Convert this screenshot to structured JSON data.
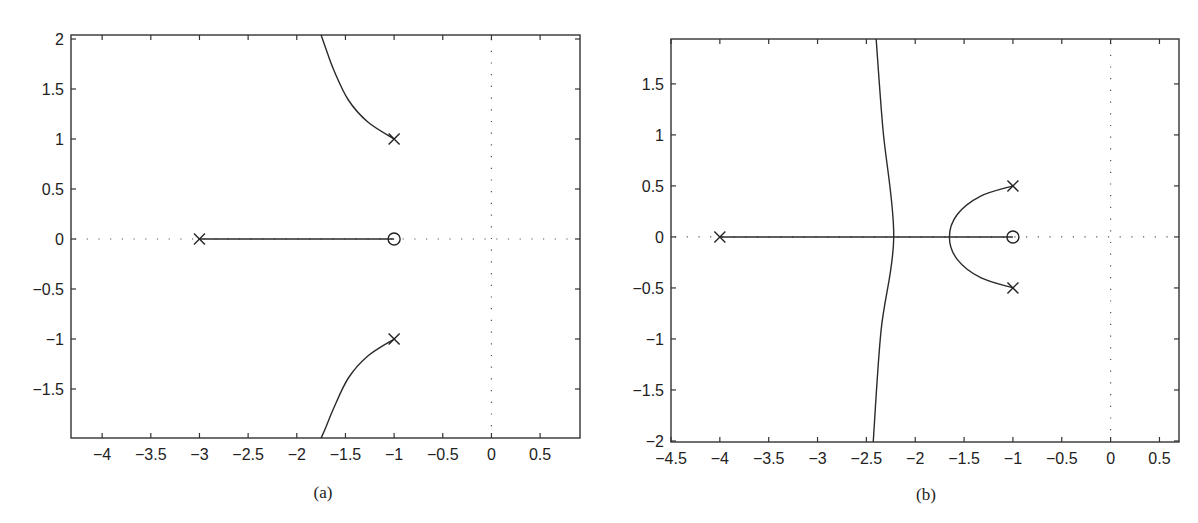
{
  "figure": {
    "captions": [
      "(a)",
      "(b)"
    ]
  },
  "chart_data": [
    {
      "type": "line",
      "title": "",
      "caption": "(a)",
      "subtype": "root-locus",
      "xlabel": "",
      "ylabel": "",
      "xlim": [
        -4.32,
        0.91
      ],
      "ylim": [
        -1.99,
        2.04
      ],
      "grid": false,
      "xticks": [
        -4,
        -3.5,
        -3,
        -2.5,
        -2,
        -1.5,
        -1,
        -0.5,
        0,
        0.5
      ],
      "xtick_labels": [
        "−4",
        "−3.5",
        "−3",
        "−2.5",
        "−2",
        "−1.5",
        "−1",
        "−0.5",
        "0",
        "0.5"
      ],
      "yticks": [
        2,
        1.5,
        1,
        0.5,
        0,
        -0.5,
        -1,
        -1.5
      ],
      "ytick_labels": [
        "2",
        "1.5",
        "1",
        "0.5",
        "0",
        "−0.5",
        "−1",
        "−1.5"
      ],
      "poles": [
        [
          -3,
          0
        ],
        [
          -1,
          1
        ],
        [
          -1,
          -1
        ]
      ],
      "zeros": [
        [
          -1,
          0
        ]
      ],
      "series": [
        {
          "name": "real-axis-branch",
          "x": [
            -3,
            -1
          ],
          "y": [
            0,
            0
          ]
        },
        {
          "name": "upper-branch",
          "x": [
            -1,
            -1.27,
            -1.47,
            -1.62,
            -1.7,
            -1.75
          ],
          "y": [
            1,
            1.17,
            1.39,
            1.69,
            1.9,
            2.04
          ]
        },
        {
          "name": "lower-branch",
          "x": [
            -1,
            -1.27,
            -1.47,
            -1.62,
            -1.7,
            -1.75
          ],
          "y": [
            -1,
            -1.17,
            -1.39,
            -1.69,
            -1.88,
            -1.99
          ]
        }
      ],
      "reference_lines": {
        "imag_axis_x": 0,
        "real_axis_y": 0,
        "style": "dotted"
      }
    },
    {
      "type": "line",
      "title": "",
      "caption": "(b)",
      "subtype": "root-locus",
      "xlabel": "",
      "ylabel": "",
      "xlim": [
        -4.5,
        0.7
      ],
      "ylim": [
        -2.01,
        1.94
      ],
      "grid": false,
      "xticks": [
        -4.5,
        -4,
        -3.5,
        -3,
        -2.5,
        -2,
        -1.5,
        -1,
        -0.5,
        0,
        0.5
      ],
      "xtick_labels": [
        "−4.5",
        "−4",
        "−3.5",
        "−3",
        "−2.5",
        "−2",
        "−1.5",
        "−1",
        "−0.5",
        "0",
        "0.5"
      ],
      "yticks": [
        1.5,
        1,
        0.5,
        0,
        -0.5,
        -1,
        -1.5,
        -2
      ],
      "ytick_labels": [
        "1.5",
        "1",
        "0.5",
        "0",
        "−0.5",
        "−1",
        "−1.5",
        "−2"
      ],
      "poles": [
        [
          -4,
          0
        ],
        [
          -1,
          0.5
        ],
        [
          -1,
          -0.5
        ]
      ],
      "zeros": [
        [
          -1,
          0
        ]
      ],
      "series": [
        {
          "name": "real-axis-branch",
          "x": [
            -4,
            -1
          ],
          "y": [
            0,
            0
          ]
        },
        {
          "name": "circle-branch",
          "x": [
            -1,
            -1.33,
            -1.57,
            -1.65,
            -1.57,
            -1.33,
            -1
          ],
          "y": [
            0.5,
            0.4,
            0.22,
            0,
            -0.22,
            -0.4,
            -0.5
          ]
        },
        {
          "name": "asymptotic-branch",
          "x": [
            -2.4,
            -2.33,
            -2.22,
            -2.35,
            -2.43
          ],
          "y": [
            1.94,
            1.05,
            0,
            -0.92,
            -2.01
          ]
        }
      ],
      "reference_lines": {
        "imag_axis_x": 0,
        "real_axis_y": 0,
        "style": "dotted"
      }
    }
  ]
}
